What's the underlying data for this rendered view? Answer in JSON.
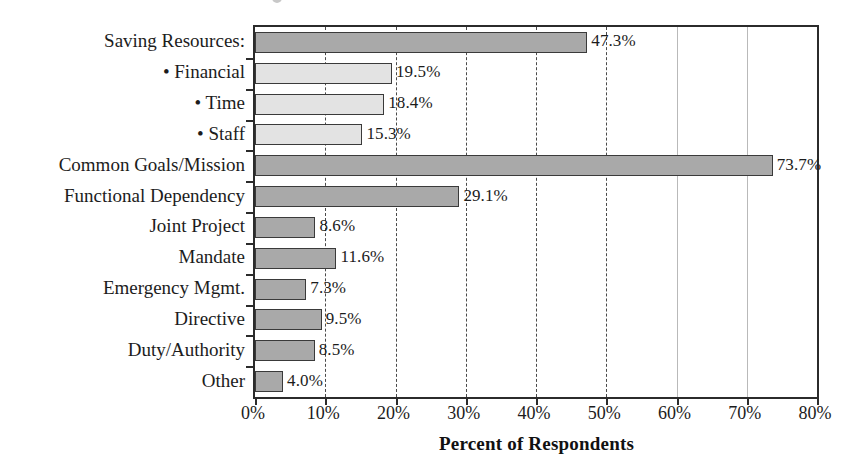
{
  "chart_data": {
    "type": "bar",
    "orientation": "horizontal",
    "title": "",
    "xlabel": "Percent of Respondents",
    "ylabel": "",
    "xlim": [
      0,
      80
    ],
    "xunit": "%",
    "grid": "vertical-dashed",
    "legend": "none",
    "categories": [
      "Saving Resources:",
      "• Financial",
      "• Time",
      "• Staff",
      "Common Goals/Mission",
      "Functional Dependency",
      "Joint Project",
      "Mandate",
      "Emergency Mgmt.",
      "Directive",
      "Duty/Authority",
      "Other"
    ],
    "values": [
      47.3,
      19.5,
      18.4,
      15.3,
      73.7,
      29.1,
      8.6,
      11.6,
      7.3,
      9.5,
      8.5,
      4.0
    ],
    "value_labels": [
      "47.3%",
      "19.5%",
      "18.4%",
      "15.3%",
      "73.7%",
      "29.1%",
      "8.6%",
      "11.6%",
      "7.3%",
      "9.5%",
      "8.5%",
      "4.0%"
    ],
    "bar_styles": [
      "dark",
      "light",
      "light",
      "light",
      "dark",
      "dark",
      "dark",
      "dark",
      "dark",
      "dark",
      "dark",
      "dark"
    ],
    "xticks": [
      0,
      10,
      20,
      30,
      40,
      50,
      60,
      70,
      80
    ],
    "xtick_labels": [
      "0%",
      "10%",
      "20%",
      "30%",
      "40%",
      "50%",
      "60%",
      "70%",
      "80%"
    ],
    "gridline_values": [
      10,
      20,
      30,
      40,
      50,
      60,
      70
    ],
    "gridline_styles": [
      "dashed",
      "dashed",
      "dashed",
      "dashed",
      "dashed",
      "faint",
      "faint"
    ],
    "colors": {
      "bar_dark": "#a9a9a9",
      "bar_light": "#e3e3e3",
      "bar_edge": "#3a3a3a",
      "axis": "#2b2b2b",
      "grid": "#4a4a4a",
      "grid_faint": "#b9b9b9",
      "text": "#1c1c1c",
      "background": "#ffffff"
    }
  }
}
